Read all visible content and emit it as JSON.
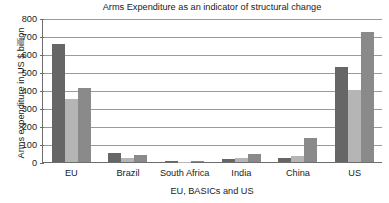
{
  "chart_data": {
    "type": "bar",
    "title": "Arms Expenditure as an indicator of structural change",
    "xlabel": "EU, BASICs and US",
    "ylabel": "Arms expenditure in US $ billion",
    "categories": [
      "EU",
      "Brazil",
      "South Africa",
      "India",
      "China",
      "US"
    ],
    "series": [
      {
        "name": "series-1",
        "color": "#666666",
        "values": [
          655,
          50,
          3,
          17,
          20,
          528
        ]
      },
      {
        "name": "series-2",
        "color": "#b5b5b5",
        "values": [
          352,
          22,
          2,
          25,
          35,
          402
        ]
      },
      {
        "name": "series-3",
        "color": "#8a8a8a",
        "values": [
          410,
          37,
          5,
          45,
          135,
          720
        ]
      }
    ],
    "ylim": [
      0,
      800
    ],
    "yticks": [
      "0",
      "100",
      "200",
      "300",
      "400",
      "500",
      "600",
      "700",
      "800"
    ],
    "ytick_values": [
      0,
      100,
      200,
      300,
      400,
      500,
      600,
      700,
      800
    ],
    "grid": true,
    "legend": "none"
  }
}
